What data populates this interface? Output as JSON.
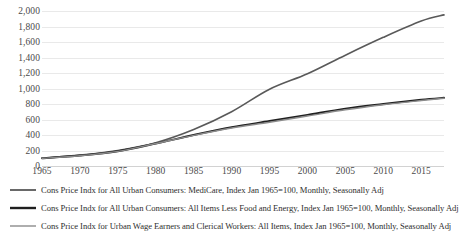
{
  "chart_data": {
    "type": "line",
    "title": "",
    "xlabel": "",
    "ylabel": "",
    "xlim": [
      1965,
      2018
    ],
    "ylim": [
      0,
      2000
    ],
    "grid": true,
    "legend_position": "bottom",
    "x_ticks": [
      "1965",
      "1970",
      "1975",
      "1980",
      "1985",
      "1990",
      "1995",
      "2000",
      "2005",
      "2010",
      "2015"
    ],
    "x_tick_values": [
      1965,
      1970,
      1975,
      1980,
      1985,
      1990,
      1995,
      2000,
      2005,
      2010,
      2015
    ],
    "y_ticks": [
      "0",
      "200",
      "400",
      "600",
      "800",
      "1,000",
      "1,200",
      "1,400",
      "1,600",
      "1,800",
      "2,000"
    ],
    "y_tick_values": [
      0,
      200,
      400,
      600,
      800,
      1000,
      1200,
      1400,
      1600,
      1800,
      2000
    ],
    "x": [
      1965,
      1970,
      1975,
      1980,
      1985,
      1990,
      1995,
      2000,
      2005,
      2010,
      2015,
      2018
    ],
    "series": [
      {
        "name": "Cons Price Indx for All Urban Consumers: MediCare, Index Jan 1965=100, Monthly, Seasonally Adj",
        "color": "#595959",
        "width": 1.6,
        "values": [
          100,
          140,
          200,
          300,
          470,
          700,
          990,
          1190,
          1430,
          1660,
          1870,
          1950
        ]
      },
      {
        "name": "Cons Price Indx for All Urban Consumers: All Items Less Food and Energy, Index Jan 1965=100, Monthly, Seasonally Adj",
        "color": "#1f1f1f",
        "width": 1.9,
        "values": [
          100,
          135,
          190,
          290,
          400,
          500,
          580,
          660,
          740,
          800,
          855,
          880
        ]
      },
      {
        "name": "Cons Price Indx for Urban Wage Earners and Clerical Workers: All Items, Index Jan 1965=100, Monthly, Seasonally Adj",
        "color": "#8c8c8c",
        "width": 1.4,
        "values": [
          100,
          132,
          188,
          290,
          395,
          490,
          565,
          645,
          725,
          790,
          845,
          875
        ]
      }
    ]
  },
  "legend": {
    "items": [
      {
        "label": "Cons Price Indx for All Urban Consumers: MediCare, Index Jan 1965=100, Monthly, Seasonally Adj",
        "color": "#595959",
        "width": 1.8
      },
      {
        "label": "Cons Price Indx for All Urban Consumers: All Items Less Food and Energy, Index Jan 1965=100, Monthly, Seasonally Adj",
        "color": "#1f1f1f",
        "width": 2.4
      },
      {
        "label": "Cons Price Indx for Urban Wage Earners and Clerical Workers: All Items, Index Jan 1965=100, Monthly, Seasonally Adj",
        "color": "#8c8c8c",
        "width": 1.4
      }
    ]
  },
  "colors": {
    "gridline": "#e9e9e9",
    "axis": "#d2d2d2",
    "tick_text": "#4a4a4a",
    "legend_text": "#2e2e2e",
    "background": "#ffffff"
  }
}
